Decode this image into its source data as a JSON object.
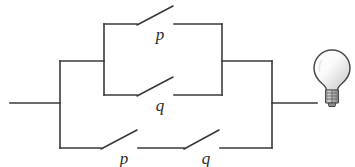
{
  "diagram": {
    "stroke_color": "#3a3a3a",
    "background_color": "#ffffff",
    "switches": [
      {
        "id": "top-p",
        "label": "p",
        "state": "open",
        "branch": "upper-parallel",
        "label_x": 160,
        "label_y": 40
      },
      {
        "id": "middle-q",
        "label": "q",
        "state": "open",
        "branch": "lower-parallel",
        "label_x": 160,
        "label_y": 111
      },
      {
        "id": "bottom-p",
        "label": "p",
        "state": "open",
        "branch": "bottom-series",
        "label_x": 124,
        "label_y": 164
      },
      {
        "id": "bottom-q",
        "label": "q",
        "state": "open",
        "branch": "bottom-series",
        "label_x": 206,
        "label_y": 164
      }
    ],
    "lamp": {
      "name": "light-bulb",
      "state": "off",
      "glass_fill_light": "#fdfdfd",
      "glass_fill_dark": "#c9c9c9",
      "base_fill": "#9a9a9a"
    },
    "terminals": {
      "input_label": "",
      "output_label": ""
    }
  }
}
